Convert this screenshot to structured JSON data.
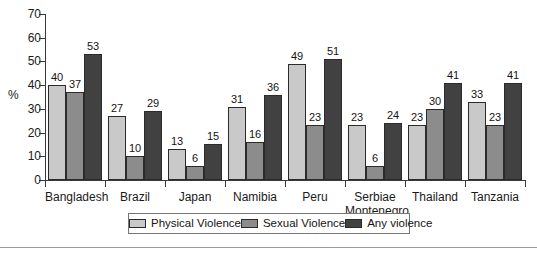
{
  "chart_data": {
    "type": "bar",
    "title": "",
    "subtitle": "",
    "xlabel": "",
    "ylabel": "%",
    "ylim": [
      0,
      70
    ],
    "yticks": [
      0,
      10,
      20,
      30,
      40,
      50,
      60,
      70
    ],
    "grid": false,
    "legend_position": "bottom",
    "categories": [
      "Bangladesh",
      "Brazil",
      "Japan",
      "Namibia",
      "Peru",
      "Serbiae Montenegro",
      "Thailand",
      "Tanzania"
    ],
    "category_lines": [
      [
        "Bangladesh"
      ],
      [
        "Brazil"
      ],
      [
        "Japan"
      ],
      [
        "Namibia"
      ],
      [
        "Peru"
      ],
      [
        "Serbiae",
        "Montenegro"
      ],
      [
        "Thailand"
      ],
      [
        "Tanzania"
      ]
    ],
    "series": [
      {
        "name": "Physical Violence",
        "color": "#c9c9c9",
        "values": [
          40,
          27,
          13,
          31,
          49,
          23,
          23,
          33
        ]
      },
      {
        "name": "Sexual Violence",
        "color": "#8c8c8c",
        "values": [
          37,
          10,
          6,
          16,
          23,
          6,
          30,
          23
        ]
      },
      {
        "name": "Any violence",
        "color": "#414141",
        "values": [
          53,
          29,
          15,
          36,
          51,
          24,
          41,
          41
        ]
      }
    ]
  },
  "axis": {
    "y_title": "%",
    "y_tick_labels": [
      "70",
      "60",
      "50",
      "40",
      "30",
      "20",
      "10",
      "0"
    ]
  },
  "legend": {
    "items": [
      {
        "label": "Physical Violence",
        "color": "#c9c9c9"
      },
      {
        "label": "Sexual Violence",
        "color": "#8c8c8c"
      },
      {
        "label": "Any violence",
        "color": "#414141"
      }
    ]
  },
  "colors": {
    "series_light": "#c9c9c9",
    "series_medium": "#8c8c8c",
    "series_dark": "#414141",
    "axis": "#3a3a3a",
    "text": "#1a1a1a",
    "rule": "#9a9a9a",
    "background": "#ffffff"
  }
}
